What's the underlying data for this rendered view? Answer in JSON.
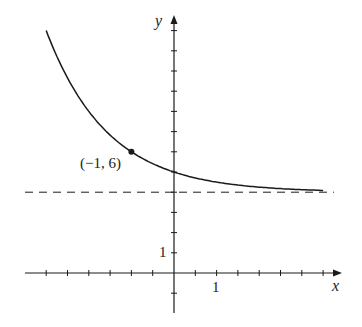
{
  "chart_data": {
    "type": "line",
    "title": "",
    "xlabel": "x",
    "ylabel": "y",
    "function": "y = 4 + 2^(-x)",
    "series": [
      {
        "name": "curve",
        "x": [
          -3,
          -2.5,
          -2,
          -1.5,
          -1,
          -0.5,
          0,
          0.5,
          1,
          1.5,
          2,
          2.5,
          3,
          3.5
        ],
        "values": [
          12,
          9.66,
          8,
          6.83,
          6,
          5.41,
          5,
          4.71,
          4.5,
          4.35,
          4.25,
          4.18,
          4.125,
          4.09
        ]
      }
    ],
    "asymptote": {
      "y": 4,
      "style": "dashed"
    },
    "highlighted_point": {
      "x": -1,
      "y": 6,
      "label": "(−1, 6)"
    },
    "x_tick_step": 0.5,
    "y_tick_step": 1,
    "xlim": [
      -3.5,
      3.9
    ],
    "ylim": [
      -2,
      12.5
    ],
    "tick_labels": {
      "x": [
        "1"
      ],
      "y": [
        "1"
      ]
    },
    "grid": false,
    "legend": "none"
  },
  "labels": {
    "x_axis": "x",
    "y_axis": "y",
    "x_tick_one": "1",
    "y_tick_one": "1",
    "point": "(−1, 6)"
  },
  "colors": {
    "ink": "#1a1a1a"
  }
}
